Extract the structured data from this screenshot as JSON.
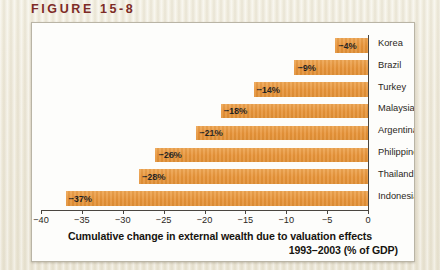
{
  "figure": {
    "label": "FIGURE 15-8",
    "label_color": "#7d2b26"
  },
  "chart_data": {
    "type": "bar",
    "orientation": "horizontal",
    "title": "",
    "categories": [
      "Korea",
      "Brazil",
      "Turkey",
      "Malaysia",
      "Argentina",
      "Philippines",
      "Thailand",
      "Indonesia"
    ],
    "values": [
      -4,
      -9,
      -14,
      -18,
      -21,
      -26,
      -28,
      -37
    ],
    "data_labels": [
      "-4%",
      "-9%",
      "-14%",
      "-18%",
      "-21%",
      "-26%",
      "-28%",
      "-37%"
    ],
    "xlabel": "Cumulative change in external wealth due to valuation effects 1993-2003 (% of GDP)",
    "xlabel_line1": "Cumulative change in external wealth due to valuation effects",
    "xlabel_line2": "1993–2003 (% of GDP)",
    "ylabel": "",
    "xlim": [
      -40,
      0
    ],
    "xticks": [
      -40,
      -35,
      -30,
      -25,
      -20,
      -15,
      -10,
      -5,
      0
    ],
    "xticklabels": [
      "−40",
      "−35",
      "−30",
      "−25",
      "−20",
      "−15",
      "−10",
      "−5",
      "0"
    ],
    "grid": false,
    "legend": false,
    "bar_color": "#e79338",
    "axis_color": "#4a4640",
    "plot_background": "#fdfdfb"
  }
}
